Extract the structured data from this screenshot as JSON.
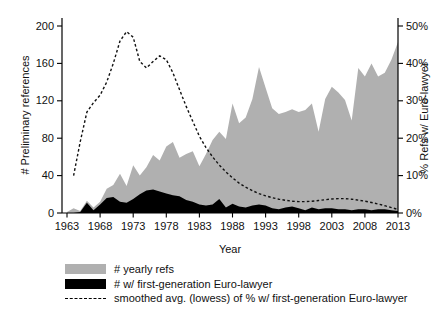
{
  "chart_data": {
    "type": "area",
    "title": "",
    "xlabel": "Year",
    "ylabel_left": "# Preliminary references",
    "ylabel_right": "% Refs w/ Euro-lawyer",
    "x_ticks": [
      1963,
      1968,
      1973,
      1978,
      1983,
      1988,
      1993,
      1998,
      2003,
      2008,
      2013
    ],
    "y_ticks_left": [
      0,
      40,
      80,
      120,
      160,
      200
    ],
    "y_ticks_right_labels": [
      "0%",
      "10%",
      "20%",
      "30%",
      "40%",
      "50%"
    ],
    "y_ticks_right_values": [
      0,
      10,
      20,
      30,
      40,
      50
    ],
    "xlim": [
      1963,
      2013
    ],
    "ylim_left": [
      0,
      200
    ],
    "ylim_right_percent": [
      0,
      50
    ],
    "grid": false,
    "legend_position": "bottom-left",
    "colors": {
      "area_gray": "#b0b0b0",
      "area_black": "#000000",
      "lowess_line": "#111111",
      "axis": "#000000",
      "text": "#111111"
    },
    "years": [
      1963,
      1964,
      1965,
      1966,
      1967,
      1968,
      1969,
      1970,
      1971,
      1972,
      1973,
      1974,
      1975,
      1976,
      1977,
      1978,
      1979,
      1980,
      1981,
      1982,
      1983,
      1984,
      1985,
      1986,
      1987,
      1988,
      1989,
      1990,
      1991,
      1992,
      1993,
      1994,
      1995,
      1996,
      1997,
      1998,
      1999,
      2000,
      2001,
      2002,
      2003,
      2004,
      2005,
      2006,
      2007,
      2008,
      2009,
      2010,
      2011,
      2012,
      2013
    ],
    "series": [
      {
        "name": "# yearly refs",
        "type": "area",
        "axis": "left",
        "color": "#b0b0b0",
        "values": [
          1,
          5,
          2,
          13,
          6,
          12,
          26,
          30,
          42,
          29,
          51,
          40,
          49,
          62,
          56,
          71,
          76,
          59,
          63,
          66,
          50,
          63,
          78,
          87,
          79,
          117,
          96,
          102,
          122,
          156,
          134,
          112,
          106,
          108,
          111,
          108,
          110,
          117,
          87,
          122,
          135,
          129,
          121,
          99,
          155,
          146,
          160,
          146,
          150,
          164,
          183
        ]
      },
      {
        "name": "# w/ first-generation Euro-lawyer",
        "type": "area",
        "axis": "left",
        "color": "#000000",
        "values": [
          0,
          0,
          1,
          11,
          3,
          9,
          16,
          17,
          12,
          11,
          15,
          20,
          24,
          25,
          23,
          21,
          19,
          18,
          14,
          12,
          9,
          8,
          9,
          15,
          6,
          10,
          7,
          6,
          8,
          9,
          8,
          5,
          4,
          6,
          7,
          5,
          3,
          6,
          4,
          5,
          5,
          4,
          4,
          3,
          4,
          4,
          3,
          4,
          4,
          3,
          2
        ]
      },
      {
        "name": "smoothed avg. (lowess) of % w/ first-generation Euro-lawyer",
        "type": "dashed-line",
        "axis": "right",
        "values_percent": [
          null,
          10,
          19,
          27,
          29.5,
          31.5,
          35,
          40,
          46,
          48.5,
          47,
          40.5,
          38.8,
          40.5,
          42,
          41,
          37.5,
          33,
          28.5,
          24.5,
          20.5,
          17.5,
          15,
          12.8,
          11,
          9.4,
          8,
          6.9,
          6,
          5.2,
          4.6,
          4.1,
          3.7,
          3.4,
          3.15,
          3.05,
          3.05,
          3.15,
          3.35,
          3.55,
          3.75,
          3.85,
          3.85,
          3.7,
          3.45,
          3.15,
          2.8,
          2.4,
          1.95,
          1.45,
          0.95
        ]
      }
    ],
    "legend": [
      {
        "label": "# yearly refs"
      },
      {
        "label": "# w/ first-generation Euro-lawyer"
      },
      {
        "label": "smoothed avg. (lowess) of % w/ first-generation Euro-lawyer"
      }
    ]
  }
}
